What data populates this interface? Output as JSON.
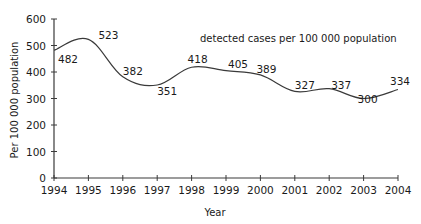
{
  "chart_data": {
    "type": "line",
    "title": "detected cases per 100 000 population",
    "xlabel": "Year",
    "ylabel": "Per 100 000 population",
    "x": [
      1994,
      1995,
      1996,
      1997,
      1998,
      1999,
      2000,
      2001,
      2002,
      2003,
      2004
    ],
    "series": [
      {
        "name": "detected cases per 100 000 population",
        "values": [
          482,
          523,
          382,
          351,
          418,
          405,
          389,
          327,
          337,
          300,
          334
        ],
        "color": "#3a3a3a",
        "smooth": true
      }
    ],
    "data_labels": [
      "482",
      "523",
      "382",
      "351",
      "418",
      "405",
      "389",
      "327",
      "337",
      "300",
      "334"
    ],
    "yticks": [
      0,
      100,
      200,
      300,
      400,
      500,
      600
    ],
    "ytick_labels": [
      "0",
      "100",
      "200",
      "300",
      "400",
      "500",
      "600"
    ],
    "xtick_labels": [
      "1994",
      "1995",
      "1996",
      "1997",
      "1998",
      "1999",
      "2000",
      "2001",
      "2002",
      "2003",
      "2004"
    ],
    "ylim": [
      0,
      600
    ],
    "xlim": [
      1994,
      2004
    ],
    "grid": false,
    "legend": "none"
  }
}
